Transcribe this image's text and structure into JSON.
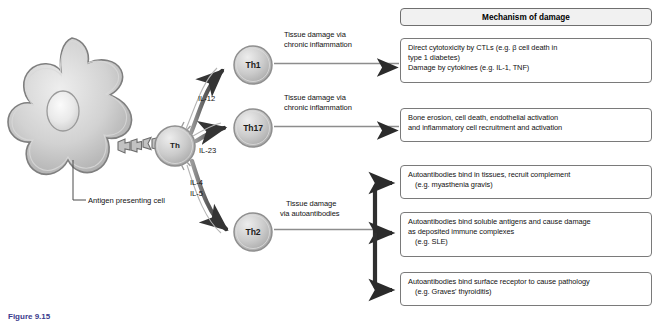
{
  "figure": {
    "caption": "Figure 9.15",
    "apc_label": "Antigen presenting cell"
  },
  "header": {
    "title": "Mechanism of damage"
  },
  "cells": [
    {
      "id": "apc",
      "label": "",
      "name": "antigen-presenting-cell"
    },
    {
      "id": "th",
      "label": "Th",
      "name": "th-cell"
    },
    {
      "id": "th1",
      "label": "Th1",
      "name": "th1-cell"
    },
    {
      "id": "th17",
      "label": "Th17",
      "name": "th17-cell"
    },
    {
      "id": "th2",
      "label": "Th2",
      "name": "th2-cell"
    }
  ],
  "cytokines": [
    {
      "label": "IL-12",
      "for": "th1"
    },
    {
      "label": "IL-23",
      "for": "th17"
    },
    {
      "label": "IL-4",
      "for": "th2"
    },
    {
      "label": "IL-5",
      "for": "th2"
    }
  ],
  "pathway_labels": {
    "th1_line1": "Tissue damage via",
    "th1_line2": "chronic inflammation",
    "th17_line1": "Tissue damage via",
    "th17_line2": "chronic inflammation",
    "th2_line1": "Tissue damage",
    "th2_line2": "via autoantibodies"
  },
  "mechanism_boxes": [
    {
      "id": "box1",
      "source": "Th1",
      "lines": [
        {
          "text": "Direct cytotoxicity by CTLs  (e.g. β cell death in",
          "indent": false
        },
        {
          "text": "type 1 diabetes)",
          "indent": false
        },
        {
          "text": "Damage by cytokines (e.g. IL-1, TNF)",
          "indent": false
        }
      ]
    },
    {
      "id": "box2",
      "source": "Th17",
      "lines": [
        {
          "text": "Bone erosion, cell death, endothelial activation",
          "indent": false
        },
        {
          "text": "and inflammatory cell recruitment and activation",
          "indent": false
        }
      ]
    },
    {
      "id": "box3",
      "source": "Th2",
      "lines": [
        {
          "text": "Autoantibodies bind in tissues, recruit complement",
          "indent": false
        },
        {
          "text": "(e.g. myasthenia gravis)",
          "indent": true
        }
      ]
    },
    {
      "id": "box4",
      "source": "Th2",
      "lines": [
        {
          "text": "Autoantibodies bind soluble antigens and cause damage",
          "indent": false
        },
        {
          "text": "as deposited immune complexes",
          "indent": false
        },
        {
          "text": "(e.g. SLE)",
          "indent": true
        }
      ]
    },
    {
      "id": "box5",
      "source": "Th2",
      "lines": [
        {
          "text": "Autoantibodies bind surface receptor to cause pathology",
          "indent": false
        },
        {
          "text": "(e.g. Graves' thyroiditis)",
          "indent": true
        }
      ]
    }
  ],
  "colors": {
    "cell_fill_light": "#e4e4e4",
    "cell_fill_mid": "#b9b9b9",
    "cell_outline": "#8c8c8c",
    "arrow_dark": "#3a3a3a",
    "box_border": "#7a7a7a",
    "header_fill": "#f1f1f1",
    "caption": "#3a3a8c"
  }
}
